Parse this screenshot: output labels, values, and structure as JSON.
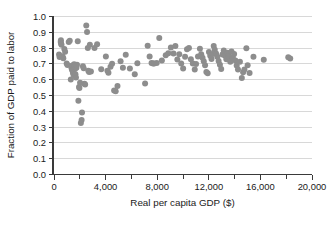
{
  "chart_data": {
    "type": "scatter",
    "title": "",
    "xlabel": "Real per capita GDP ($)",
    "ylabel": "Fraction of GDP paid to labor",
    "xlim": [
      0,
      20000
    ],
    "ylim": [
      0.0,
      1.0
    ],
    "grid": true,
    "grid_axis": "y",
    "legend": null,
    "marker_color": "#8d8d8d",
    "marker_size": 3.0,
    "x_ticks": [
      0,
      4000,
      8000,
      12000,
      16000,
      20000
    ],
    "x_tick_labels": [
      "0",
      "4,000",
      "8,000",
      "12,000",
      "16,000",
      "20,000"
    ],
    "x_minor_ticks": [
      2000,
      6000,
      10000,
      14000,
      18000
    ],
    "y_ticks": [
      0.0,
      0.1,
      0.2,
      0.3,
      0.4,
      0.5,
      0.6,
      0.7,
      0.8,
      0.9,
      1.0
    ],
    "y_tick_labels": [
      "0.0",
      "0.1",
      "0.2",
      "0.3",
      "0.4",
      "0.5",
      "0.6",
      "0.7",
      "0.8",
      "0.9",
      "1.0"
    ],
    "points": [
      [
        430,
        0.757
      ],
      [
        470,
        0.74
      ],
      [
        560,
        0.836
      ],
      [
        575,
        0.846
      ],
      [
        590,
        0.825
      ],
      [
        620,
        0.818
      ],
      [
        700,
        0.745
      ],
      [
        760,
        0.733
      ],
      [
        840,
        0.791
      ],
      [
        900,
        0.773
      ],
      [
        1020,
        0.7
      ],
      [
        1080,
        0.69
      ],
      [
        1180,
        0.836
      ],
      [
        1260,
        0.843
      ],
      [
        1340,
        0.598
      ],
      [
        1390,
        0.672
      ],
      [
        1430,
        0.662
      ],
      [
        1460,
        0.687
      ],
      [
        1490,
        0.651
      ],
      [
        1510,
        0.639
      ],
      [
        1560,
        0.627
      ],
      [
        1600,
        0.694
      ],
      [
        1640,
        0.682
      ],
      [
        1660,
        0.665
      ],
      [
        1700,
        0.632
      ],
      [
        1740,
        0.61
      ],
      [
        1780,
        0.672
      ],
      [
        1820,
        0.692
      ],
      [
        1880,
        0.84
      ],
      [
        1930,
        0.464
      ],
      [
        1980,
        0.551
      ],
      [
        2010,
        0.544
      ],
      [
        2060,
        0.578
      ],
      [
        2120,
        0.323
      ],
      [
        2180,
        0.341
      ],
      [
        2210,
        0.389
      ],
      [
        2280,
        0.682
      ],
      [
        2340,
        0.67
      ],
      [
        2400,
        0.571
      ],
      [
        2450,
        0.567
      ],
      [
        2540,
        0.94
      ],
      [
        2600,
        0.899
      ],
      [
        2660,
        0.798
      ],
      [
        2700,
        0.654
      ],
      [
        2760,
        0.645
      ],
      [
        2820,
        0.818
      ],
      [
        2900,
        0.648
      ],
      [
        3180,
        0.798
      ],
      [
        3380,
        0.821
      ],
      [
        3700,
        0.663
      ],
      [
        4060,
        0.744
      ],
      [
        4180,
        0.653
      ],
      [
        4260,
        0.641
      ],
      [
        4420,
        0.679
      ],
      [
        4540,
        0.698
      ],
      [
        4700,
        0.528
      ],
      [
        4820,
        0.524
      ],
      [
        4960,
        0.557
      ],
      [
        5200,
        0.714
      ],
      [
        5380,
        0.672
      ],
      [
        5600,
        0.754
      ],
      [
        5920,
        0.668
      ],
      [
        6300,
        0.632
      ],
      [
        6500,
        0.701
      ],
      [
        7100,
        0.573
      ],
      [
        7300,
        0.812
      ],
      [
        7450,
        0.744
      ],
      [
        7600,
        0.703
      ],
      [
        7720,
        0.7
      ],
      [
        7800,
        0.699
      ],
      [
        8000,
        0.702
      ],
      [
        8200,
        0.861
      ],
      [
        8400,
        0.718
      ],
      [
        8700,
        0.752
      ],
      [
        8900,
        0.764
      ],
      [
        9100,
        0.801
      ],
      [
        9300,
        0.762
      ],
      [
        9450,
        0.81
      ],
      [
        9600,
        0.724
      ],
      [
        9750,
        0.758
      ],
      [
        9900,
        0.699
      ],
      [
        10050,
        0.668
      ],
      [
        10200,
        0.742
      ],
      [
        10350,
        0.79
      ],
      [
        10500,
        0.798
      ],
      [
        10650,
        0.726
      ],
      [
        10800,
        0.7
      ],
      [
        10950,
        0.662
      ],
      [
        11050,
        0.696
      ],
      [
        11200,
        0.744
      ],
      [
        11350,
        0.792
      ],
      [
        11450,
        0.758
      ],
      [
        11550,
        0.736
      ],
      [
        11650,
        0.714
      ],
      [
        11750,
        0.688
      ],
      [
        11850,
        0.645
      ],
      [
        11950,
        0.638
      ],
      [
        12050,
        0.772
      ],
      [
        12150,
        0.749
      ],
      [
        12250,
        0.728
      ],
      [
        12350,
        0.76
      ],
      [
        12420,
        0.81
      ],
      [
        12500,
        0.786
      ],
      [
        12600,
        0.762
      ],
      [
        12700,
        0.742
      ],
      [
        12800,
        0.715
      ],
      [
        12900,
        0.692
      ],
      [
        13000,
        0.664
      ],
      [
        13100,
        0.757
      ],
      [
        13200,
        0.782
      ],
      [
        13300,
        0.748
      ],
      [
        13400,
        0.726
      ],
      [
        13500,
        0.768
      ],
      [
        13600,
        0.745
      ],
      [
        13700,
        0.711
      ],
      [
        13800,
        0.776
      ],
      [
        13900,
        0.738
      ],
      [
        14000,
        0.76
      ],
      [
        14100,
        0.719
      ],
      [
        14200,
        0.686
      ],
      [
        14300,
        0.662
      ],
      [
        14450,
        0.71
      ],
      [
        14600,
        0.608
      ],
      [
        14700,
        0.644
      ],
      [
        14800,
        0.662
      ],
      [
        14950,
        0.796
      ],
      [
        15050,
        0.688
      ],
      [
        15200,
        0.64
      ],
      [
        15500,
        0.742
      ],
      [
        16300,
        0.723
      ],
      [
        18200,
        0.739
      ],
      [
        18350,
        0.731
      ]
    ]
  }
}
